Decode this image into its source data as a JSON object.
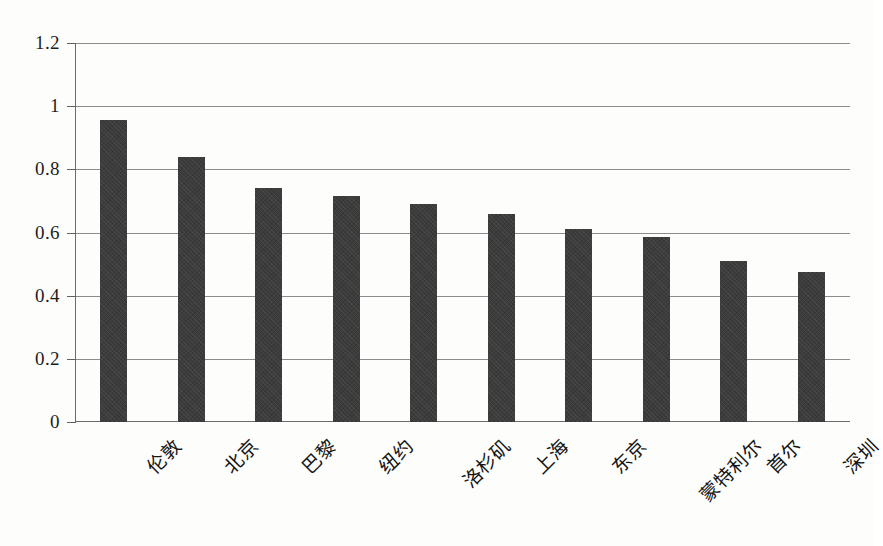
{
  "chart_data": {
    "type": "bar",
    "title": "",
    "subtitle": "",
    "xlabel": "",
    "ylabel": "",
    "ylim": [
      0,
      1.2
    ],
    "ytick_values": [
      0,
      0.2,
      0.4,
      0.6,
      0.8,
      1,
      1.2
    ],
    "ytick_labels": [
      "0",
      "0.2",
      "0.4",
      "0.6",
      "0.8",
      "1",
      "1.2"
    ],
    "grid": "horizontal",
    "legend": "none",
    "bar_color": "#3c3c3c",
    "axis_color": "#6b6b6b",
    "gridline_color": "#8c8c8c",
    "categories": [
      "伦敦",
      "北京",
      "巴黎",
      "纽约",
      "洛杉矶",
      "上海",
      "东京",
      "蒙特利尔",
      "首尔",
      "深圳"
    ],
    "values": [
      0.955,
      0.84,
      0.74,
      0.715,
      0.69,
      0.66,
      0.61,
      0.585,
      0.51,
      0.475
    ]
  }
}
